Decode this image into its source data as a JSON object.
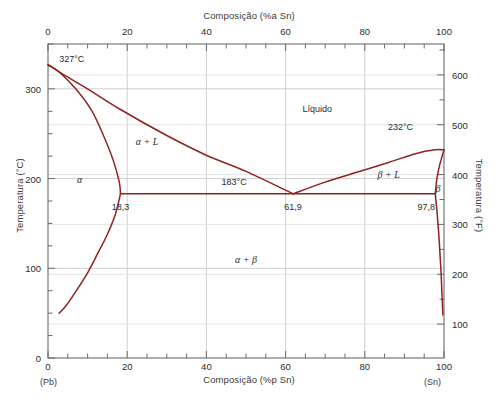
{
  "figure": {
    "top_axis_title": "Composição (%a Sn)",
    "bottom_axis_title": "Composição (%p Sn)",
    "left_axis_title": "Temperatura (°C)",
    "right_axis_title": "Temperatura (°F)",
    "left_corner_label": "(Pb)",
    "right_corner_label": "(Sn)"
  },
  "chart_data": {
    "type": "line",
    "xlabel": "Composição (%p Sn)",
    "ylabel": "Temperatura (°C)",
    "xlim": [
      0,
      100
    ],
    "ylim": [
      0,
      350
    ],
    "ylim_f": [
      32,
      662
    ],
    "grid": true,
    "legend_position": "none",
    "x_ticks_bottom": [
      "0",
      "20",
      "40",
      "60",
      "80",
      "100"
    ],
    "x_tick_values_bottom": [
      0,
      20,
      40,
      60,
      80,
      100
    ],
    "x_ticks_top": [
      "0",
      "20",
      "40",
      "60",
      "80",
      "100"
    ],
    "x_tick_values_top": [
      0,
      20,
      40,
      60,
      80,
      100
    ],
    "y_ticks_left": [
      "0",
      "100",
      "200",
      "300"
    ],
    "y_tick_values_left": [
      0,
      100,
      200,
      300
    ],
    "y_ticks_right": [
      "100",
      "200",
      "300",
      "400",
      "500",
      "600"
    ],
    "y_tick_values_right": [
      100,
      200,
      300,
      400,
      500,
      600
    ],
    "region_labels": [
      {
        "text": "Líquido",
        "x": 68,
        "y": 278,
        "style": "plain"
      },
      {
        "text": "α + L",
        "x": 25,
        "y": 242,
        "style": "serif"
      },
      {
        "text": "β + L",
        "x": 86,
        "y": 205,
        "style": "serif"
      },
      {
        "text": "α",
        "x": 8,
        "y": 200,
        "style": "serif"
      },
      {
        "text": "β",
        "x": 98.5,
        "y": 190,
        "style": "serif"
      },
      {
        "text": "α + β",
        "x": 50,
        "y": 110,
        "style": "serif"
      }
    ],
    "point_labels": [
      {
        "text": "327°C",
        "x": 6,
        "y": 333,
        "style": "plain"
      },
      {
        "text": "232°C",
        "x": 89,
        "y": 258,
        "style": "plain"
      },
      {
        "text": "183°C",
        "x": 47,
        "y": 196,
        "style": "plain"
      },
      {
        "text": "18,3",
        "x": 18.3,
        "y": 168,
        "style": "plain"
      },
      {
        "text": "61,9",
        "x": 61.9,
        "y": 168,
        "style": "plain"
      },
      {
        "text": "97,8",
        "x": 95.5,
        "y": 168,
        "style": "plain"
      }
    ],
    "series": [
      {
        "name": "liquidus-alpha",
        "points": [
          [
            0,
            327
          ],
          [
            5,
            313
          ],
          [
            10,
            300
          ],
          [
            18.3,
            277
          ],
          [
            30,
            248
          ],
          [
            40,
            226
          ],
          [
            50,
            208
          ],
          [
            61.9,
            183
          ]
        ]
      },
      {
        "name": "solidus-alpha",
        "points": [
          [
            0,
            327
          ],
          [
            3,
            318
          ],
          [
            7,
            300
          ],
          [
            11,
            276
          ],
          [
            14,
            248
          ],
          [
            16.5,
            220
          ],
          [
            18.0,
            196
          ],
          [
            18.3,
            183
          ]
        ]
      },
      {
        "name": "solvus-alpha",
        "points": [
          [
            18.3,
            183
          ],
          [
            17,
            160
          ],
          [
            15,
            138
          ],
          [
            12.5,
            116
          ],
          [
            10,
            95
          ],
          [
            7,
            74
          ],
          [
            4.5,
            58
          ],
          [
            2.8,
            50
          ]
        ]
      },
      {
        "name": "liquidus-beta",
        "points": [
          [
            61.9,
            183
          ],
          [
            70,
            196
          ],
          [
            78,
            207
          ],
          [
            86,
            218
          ],
          [
            93,
            228
          ],
          [
            97.8,
            232
          ],
          [
            100,
            232
          ]
        ]
      },
      {
        "name": "solidus-beta",
        "points": [
          [
            100,
            232
          ],
          [
            98.9,
            215
          ],
          [
            98.2,
            200
          ],
          [
            97.8,
            183
          ]
        ]
      },
      {
        "name": "solvus-beta",
        "points": [
          [
            97.8,
            183
          ],
          [
            98.3,
            160
          ],
          [
            98.8,
            130
          ],
          [
            99.2,
            100
          ],
          [
            99.5,
            70
          ],
          [
            99.7,
            48
          ]
        ]
      },
      {
        "name": "eutectic-isotherm",
        "points": [
          [
            18.3,
            183
          ],
          [
            97.8,
            183
          ]
        ]
      }
    ],
    "key_points": {
      "pb_melting_point_c": 327,
      "sn_melting_point_c": 232,
      "eutectic_temp_c": 183,
      "eutectic_composition": 61.9,
      "alpha_max_solubility": 18.3,
      "beta_min_composition": 97.8
    },
    "colors": {
      "curve": "#8e2321",
      "grid": "#c9c9c9",
      "axis": "#6b6b6b",
      "text": "#2b2b2b",
      "background": "#ffffff"
    }
  }
}
